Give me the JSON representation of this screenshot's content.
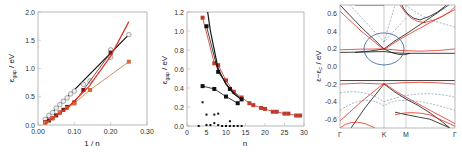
{
  "chart_data": [
    {
      "type": "scatter",
      "panel": "left",
      "xlabel": "1 / n",
      "ylabel": "ε_gap / eV",
      "xlim": [
        0.0,
        0.3
      ],
      "ylim": [
        0.0,
        2.0
      ],
      "xticks": [
        "0.00",
        "0.10",
        "0.20",
        "0.30"
      ],
      "yticks": [
        "0.0",
        "0.5",
        "1.0",
        "1.5",
        "2.0"
      ],
      "series": [
        {
          "name": "black linear fit",
          "style": "line",
          "color": "#111111",
          "x": [
            0.02,
            0.25
          ],
          "y": [
            0.1,
            1.6
          ]
        },
        {
          "name": "open circles",
          "style": "markers-open-circle",
          "color": "#777777",
          "x": [
            0.02,
            0.03,
            0.04,
            0.05,
            0.06,
            0.07,
            0.08,
            0.09,
            0.1,
            0.125,
            0.143,
            0.2,
            0.2,
            0.25
          ],
          "y": [
            0.1,
            0.17,
            0.22,
            0.3,
            0.36,
            0.42,
            0.48,
            0.55,
            0.6,
            0.72,
            0.78,
            1.33,
            1.2,
            1.6
          ]
        },
        {
          "name": "dark red filled squares",
          "style": "markers-line",
          "color": "#7a1010",
          "x": [
            0.02,
            0.03,
            0.04,
            0.05,
            0.06,
            0.07,
            0.08,
            0.1,
            0.125,
            0.2
          ],
          "y": [
            0.05,
            0.08,
            0.12,
            0.17,
            0.22,
            0.27,
            0.32,
            0.4,
            0.62,
            1.28
          ]
        },
        {
          "name": "orange squares",
          "style": "markers-line",
          "color": "#d26a3a",
          "x": [
            0.02,
            0.04,
            0.06,
            0.08,
            0.1,
            0.143,
            0.25
          ],
          "y": [
            0.04,
            0.12,
            0.22,
            0.3,
            0.38,
            0.62,
            1.12
          ]
        },
        {
          "name": "red fit curve",
          "style": "line",
          "color": "#e03020",
          "x": [
            0.02,
            0.08,
            0.14,
            0.2,
            0.25
          ],
          "y": [
            0.02,
            0.3,
            0.68,
            1.22,
            1.83
          ]
        }
      ]
    },
    {
      "type": "line",
      "panel": "middle",
      "xlabel": "n",
      "ylabel": "ε_gap / eV",
      "xlim": [
        0,
        30
      ],
      "ylim": [
        0.0,
        1.2
      ],
      "xticks": [
        "0",
        "5",
        "10",
        "15",
        "20",
        "25",
        "30"
      ],
      "yticks": [
        "0.0",
        "0.2",
        "0.4",
        "0.6",
        "0.8",
        "1.0",
        "1.2"
      ],
      "series": [
        {
          "name": "red triangles",
          "style": "markers-line",
          "color": "#c0392b",
          "x": [
            4,
            7,
            8,
            10,
            12,
            14,
            16,
            17,
            19,
            20,
            22,
            23,
            25,
            26,
            28,
            29
          ],
          "y": [
            1.14,
            0.66,
            0.64,
            0.48,
            0.36,
            0.3,
            0.24,
            0.22,
            0.19,
            0.18,
            0.15,
            0.15,
            0.13,
            0.13,
            0.11,
            0.11
          ]
        },
        {
          "name": "black circles",
          "style": "markers-line",
          "color": "#111111",
          "x": [
            5,
            8,
            11,
            14
          ],
          "y": [
            1.05,
            0.57,
            0.39,
            0.28
          ]
        },
        {
          "name": "black fit curve",
          "style": "line",
          "color": "#111111",
          "x": [
            5.3,
            6,
            8,
            10,
            12,
            14
          ],
          "y": [
            1.2,
            1.0,
            0.6,
            0.44,
            0.34,
            0.28
          ]
        },
        {
          "name": "black squares",
          "style": "markers-line",
          "color": "#111111",
          "x": [
            4,
            7,
            10,
            13
          ],
          "y": [
            0.42,
            0.39,
            0.31,
            0.24
          ]
        },
        {
          "name": "small black markers",
          "style": "markers",
          "color": "#111111",
          "x": [
            3,
            4,
            5,
            5,
            6,
            7,
            7,
            8,
            8,
            9,
            10,
            11,
            11,
            12,
            13,
            14
          ],
          "y": [
            0.0,
            0.25,
            0.12,
            0.01,
            0.01,
            0.12,
            0.03,
            0.13,
            0.01,
            0.0,
            0.0,
            0.05,
            0.0,
            0.0,
            0.0,
            0.0
          ]
        }
      ]
    },
    {
      "type": "line",
      "panel": "right",
      "title": "band structure",
      "xlabel": "",
      "ylabel": "ε−ε_F / eV",
      "ylim": [
        -0.7,
        0.7
      ],
      "xticks": [
        "Γ",
        "K",
        "M",
        "Γ"
      ],
      "yticks": [
        "-0.6",
        "-0.4",
        "-0.2",
        "0.0",
        "0.2",
        "0.4",
        "0.6"
      ],
      "annotations": [
        "blue ellipse highlighting crossing near K at ~0.2 eV"
      ],
      "series": [
        {
          "name": "black bands",
          "color": "#111111"
        },
        {
          "name": "red bands",
          "color": "#e03020"
        },
        {
          "name": "dashed blue bands",
          "color": "#4a6a8a"
        }
      ]
    }
  ]
}
